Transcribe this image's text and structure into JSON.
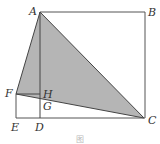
{
  "figure": {
    "points": {
      "A": {
        "label": "A",
        "x": 40,
        "y": 12
      },
      "B": {
        "label": "B",
        "x": 145,
        "y": 12
      },
      "C": {
        "label": "C",
        "x": 144,
        "y": 118
      },
      "D": {
        "label": "D",
        "x": 40,
        "y": 118
      },
      "E": {
        "label": "E",
        "x": 16,
        "y": 118
      },
      "F": {
        "label": "F",
        "x": 16,
        "y": 94
      },
      "G": {
        "label": "G",
        "x": 40,
        "y": 99
      },
      "H": {
        "label": "H",
        "x": 40,
        "y": 96
      }
    },
    "shaded_region": "triangle AFC",
    "shade_color": "#b5b5b5",
    "line_color": "#444444",
    "caption": "图"
  }
}
